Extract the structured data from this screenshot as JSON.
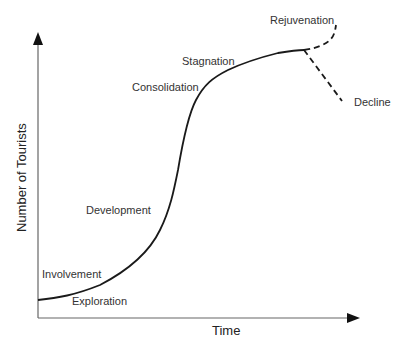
{
  "diagram": {
    "axes": {
      "x_label": "Time",
      "y_label": "Number of Tourists"
    },
    "stages": [
      {
        "id": "exploration",
        "label": "Exploration"
      },
      {
        "id": "involvement",
        "label": "Involvement"
      },
      {
        "id": "development",
        "label": "Development"
      },
      {
        "id": "consolidation",
        "label": "Consolidation"
      },
      {
        "id": "stagnation",
        "label": "Stagnation"
      },
      {
        "id": "rejuvenation",
        "label": "Rejuvenation"
      },
      {
        "id": "decline",
        "label": "Decline"
      }
    ],
    "colors": {
      "curve": "#1a1a1a",
      "axis": "#555555",
      "text": "#333333",
      "background": "#ffffff"
    }
  }
}
